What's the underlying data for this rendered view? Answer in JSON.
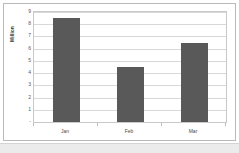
{
  "chart_data": {
    "type": "bar",
    "title": "",
    "subtitle": "",
    "xlabel": "",
    "ylabel": "Million",
    "categories": [
      "Jan",
      "Feb",
      "Mar"
    ],
    "values": [
      8.5,
      4.5,
      6.5
    ],
    "series": [
      {
        "name": "Million",
        "values": [
          8.5,
          4.5,
          6.5
        ]
      }
    ],
    "ylim": [
      0,
      9
    ],
    "ytick_labels": [
      "9",
      "8",
      "7",
      "6",
      "5",
      "4",
      "3",
      "2",
      "1",
      "-"
    ],
    "ytick_values": [
      9,
      8,
      7,
      6,
      5,
      4,
      3,
      2,
      1,
      0
    ],
    "grid": true,
    "grid_axis": "y",
    "legend": false,
    "legend_position": "none",
    "bar_color": "#595959",
    "plot_background": "#ffffff",
    "gridline_color": "#d8d8d8",
    "axis_color": "#c9c9c9"
  },
  "frame": {
    "border_color": "#b9b9b9",
    "background": "#ffffff"
  }
}
